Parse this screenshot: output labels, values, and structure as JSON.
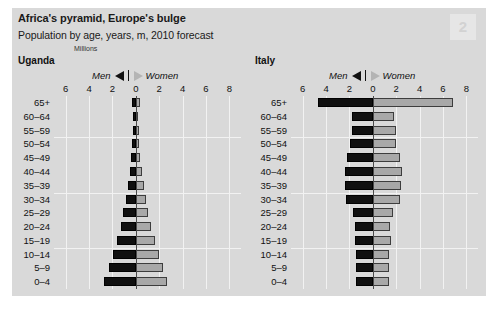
{
  "header": {
    "title": "Africa's pyramid, Europe's bulge",
    "subtitle": "Population by age, years, m, 2010 forecast",
    "units_label": "Millions",
    "page_marker": "2"
  },
  "legend": {
    "men_label": "Men",
    "women_label": "Women",
    "men_icon": "triangle-left-icon",
    "women_icon": "triangle-right-icon"
  },
  "chart_data": [
    {
      "type": "bar",
      "orientation": "population-pyramid",
      "title": "Uganda",
      "xlabel": "Millions",
      "ylabel": "",
      "categories": [
        "65+",
        "60–64",
        "55–59",
        "50–54",
        "45–49",
        "40–44",
        "35–39",
        "30–34",
        "25–29",
        "20–24",
        "15–19",
        "10–14",
        "5–9",
        "0–4"
      ],
      "tick_labels": [
        "6",
        "4",
        "2",
        "0",
        "2",
        "4",
        "6",
        "8"
      ],
      "tick_values": [
        -6,
        -4,
        -2,
        0,
        2,
        4,
        6,
        8
      ],
      "xlim": [
        -7,
        9
      ],
      "grid": true,
      "legend_position": "top",
      "series": [
        {
          "name": "Men",
          "color": "#101010",
          "side": "left",
          "values": [
            0.32,
            0.2,
            0.24,
            0.3,
            0.4,
            0.52,
            0.68,
            0.86,
            1.06,
            1.3,
            1.6,
            1.95,
            2.3,
            2.7
          ]
        },
        {
          "name": "Women",
          "color": "#a8a8a8",
          "side": "right",
          "values": [
            0.35,
            0.2,
            0.24,
            0.3,
            0.4,
            0.52,
            0.7,
            0.88,
            1.08,
            1.32,
            1.6,
            1.95,
            2.3,
            2.7
          ]
        }
      ]
    },
    {
      "type": "bar",
      "orientation": "population-pyramid",
      "title": "Italy",
      "xlabel": "Millions",
      "ylabel": "",
      "categories": [
        "65+",
        "60–64",
        "55–59",
        "50–54",
        "45–49",
        "40–44",
        "35–39",
        "30–34",
        "25–29",
        "20–24",
        "15–19",
        "10–14",
        "5–9",
        "0–4"
      ],
      "tick_labels": [
        "6",
        "4",
        "2",
        "0",
        "2",
        "4",
        "6",
        "8"
      ],
      "tick_values": [
        -6,
        -4,
        -2,
        0,
        2,
        4,
        6,
        8
      ],
      "xlim": [
        -7,
        9
      ],
      "grid": true,
      "legend_position": "top",
      "series": [
        {
          "name": "Men",
          "color": "#101010",
          "side": "left",
          "values": [
            4.7,
            1.75,
            1.8,
            1.95,
            2.25,
            2.4,
            2.4,
            2.3,
            1.7,
            1.5,
            1.55,
            1.45,
            1.4,
            1.45
          ]
        },
        {
          "name": "Women",
          "color": "#a8a8a8",
          "side": "right",
          "values": [
            6.9,
            1.85,
            1.95,
            2.0,
            2.3,
            2.5,
            2.45,
            2.3,
            1.75,
            1.5,
            1.55,
            1.4,
            1.35,
            1.4
          ]
        }
      ]
    }
  ]
}
